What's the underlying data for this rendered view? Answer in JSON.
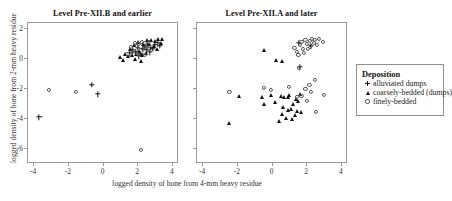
{
  "figure": {
    "xlabel": "logged density of bone from 4-mm heavy residue",
    "ylabel": "logged density of bone from 2-mm heavy residue",
    "xticks": [
      "-4",
      "-2",
      "0",
      "2",
      "4"
    ],
    "yticks": [
      "2",
      "0",
      "-2",
      "-4",
      "-6"
    ]
  },
  "legend": {
    "title": "Deposition",
    "entries": [
      {
        "marker": "plus-marker",
        "label": "alluviated dumps"
      },
      {
        "marker": "triangle-marker",
        "label": "coarsely-bedded (dumps)"
      },
      {
        "marker": "circle-marker",
        "label": "finely-bedded"
      }
    ]
  },
  "chart_data": {
    "type": "scatter",
    "title": "",
    "xlabel": "logged density of bone from 4-mm heavy residue",
    "ylabel": "logged density of bone from 2-mm heavy residue",
    "xlim": [
      -4.35,
      4.35
    ],
    "ylim": [
      -7.0,
      2.4
    ],
    "xticks": [
      -4,
      -2,
      0,
      2,
      4
    ],
    "yticks": [
      2,
      0,
      -2,
      -4,
      -6
    ],
    "grid": false,
    "legend_position": "right-outside",
    "legend_title": "Deposition",
    "series_definitions": [
      {
        "name": "alluviated dumps",
        "marker": "+",
        "color": "#111111"
      },
      {
        "name": "coarsely-bedded (dumps)",
        "marker": "triangle",
        "color": "#111111"
      },
      {
        "name": "finely-bedded",
        "marker": "open-circle",
        "color": "#555555"
      }
    ],
    "panels": [
      {
        "title": "Level Pre-XII.B and earlier",
        "series": [
          {
            "name": "alluviated dumps",
            "marker": "+",
            "points": [
              [
                -3.65,
                -3.95
              ],
              [
                -0.62,
                -1.78
              ],
              [
                -0.28,
                -2.42
              ],
              [
                1.55,
                0.32
              ],
              [
                1.72,
                0.52
              ],
              [
                1.92,
                0.42
              ],
              [
                2.05,
                0.66
              ],
              [
                2.18,
                0.3
              ],
              [
                2.3,
                0.58
              ],
              [
                2.42,
                0.72
              ],
              [
                2.55,
                0.52
              ],
              [
                2.62,
                0.86
              ],
              [
                2.78,
                0.7
              ],
              [
                2.9,
                0.62
              ],
              [
                3.02,
                0.88
              ],
              [
                3.18,
                0.98
              ],
              [
                3.3,
                0.8
              ],
              [
                2.12,
                0.12
              ],
              [
                2.72,
                0.38
              ]
            ]
          },
          {
            "name": "coarsely-bedded (dumps)",
            "marker": "triangle",
            "points": [
              [
                1.02,
                0.05
              ],
              [
                1.18,
                -0.12
              ],
              [
                1.3,
                0.28
              ],
              [
                1.45,
                0.12
              ],
              [
                1.58,
                0.62
              ],
              [
                1.7,
                0.18
              ],
              [
                1.8,
                0.85
              ],
              [
                1.95,
                0.3
              ],
              [
                2.02,
                1.08
              ],
              [
                2.1,
                0.48
              ],
              [
                2.22,
                -0.22
              ],
              [
                2.35,
                0.92
              ],
              [
                2.48,
                0.35
              ],
              [
                2.58,
                1.18
              ],
              [
                2.7,
                0.92
              ],
              [
                2.82,
                1.22
              ],
              [
                2.95,
                0.78
              ],
              [
                3.05,
                1.12
              ],
              [
                3.2,
                1.3
              ],
              [
                3.35,
                0.98
              ],
              [
                3.42,
                1.25
              ],
              [
                2.28,
                0.2
              ],
              [
                1.88,
                -0.05
              ],
              [
                3.12,
                0.62
              ]
            ]
          },
          {
            "name": "finely-bedded",
            "marker": "open-circle",
            "points": [
              [
                -3.1,
                -2.1
              ],
              [
                -1.52,
                -2.26
              ],
              [
                2.2,
                -6.1
              ],
              [
                1.62,
                0.72
              ],
              [
                1.85,
                0.98
              ],
              [
                2.0,
                0.82
              ],
              [
                2.12,
                0.95
              ],
              [
                2.25,
                1.05
              ],
              [
                2.35,
                0.6
              ],
              [
                2.45,
                1.0
              ],
              [
                2.55,
                0.72
              ],
              [
                2.68,
                1.1
              ],
              [
                2.05,
                0.25
              ],
              [
                2.42,
                0.18
              ],
              [
                1.75,
                0.4
              ]
            ]
          }
        ]
      },
      {
        "title": "Level Pre-XII.A and later",
        "series": [
          {
            "name": "alluviated dumps",
            "marker": "+",
            "points": [
              [
                1.58,
                1.02
              ],
              [
                2.28,
                0.78
              ],
              [
                1.62,
                -0.62
              ]
            ]
          },
          {
            "name": "coarsely-bedded (dumps)",
            "marker": "triangle",
            "points": [
              [
                -0.42,
                0.52
              ],
              [
                0.28,
                -0.15
              ],
              [
                0.62,
                -0.18
              ],
              [
                -2.42,
                -4.35
              ],
              [
                -1.88,
                -2.55
              ],
              [
                -0.52,
                -2.58
              ],
              [
                -0.42,
                -3.05
              ],
              [
                -0.05,
                -2.48
              ],
              [
                0.18,
                -2.95
              ],
              [
                0.52,
                -2.52
              ],
              [
                0.72,
                -2.58
              ],
              [
                0.58,
                -3.72
              ],
              [
                0.82,
                -4.02
              ],
              [
                0.95,
                -2.6
              ],
              [
                1.02,
                -2.48
              ],
              [
                1.12,
                -3.38
              ],
              [
                1.25,
                -3.05
              ],
              [
                1.38,
                -3.82
              ],
              [
                1.48,
                -3.52
              ],
              [
                1.52,
                -2.88
              ],
              [
                0.95,
                -3.48
              ],
              [
                1.62,
                -2.42
              ],
              [
                1.72,
                -3.62
              ],
              [
                0.42,
                -4.18
              ],
              [
                1.18,
                -4.08
              ],
              [
                0.65,
                -3.28
              ],
              [
                1.42,
                -2.72
              ]
            ]
          },
          {
            "name": "finely-bedded",
            "marker": "open-circle",
            "points": [
              [
                1.32,
                0.68
              ],
              [
                1.45,
                0.42
              ],
              [
                1.55,
                0.22
              ],
              [
                1.62,
                0.85
              ],
              [
                1.72,
                1.08
              ],
              [
                1.8,
                0.58
              ],
              [
                1.88,
                0.35
              ],
              [
                1.95,
                1.22
              ],
              [
                2.05,
                0.92
              ],
              [
                2.12,
                0.62
              ],
              [
                2.2,
                1.12
              ],
              [
                2.28,
                0.82
              ],
              [
                2.35,
                1.28
              ],
              [
                2.45,
                0.98
              ],
              [
                2.52,
                1.18
              ],
              [
                2.62,
                0.88
              ],
              [
                2.72,
                1.25
              ],
              [
                2.95,
                1.05
              ],
              [
                1.58,
                -0.68
              ],
              [
                -2.42,
                -2.28
              ],
              [
                -0.42,
                -2.02
              ],
              [
                -0.05,
                -2.15
              ],
              [
                1.02,
                -1.95
              ],
              [
                1.45,
                -2.62
              ],
              [
                1.72,
                -2.55
              ],
              [
                2.18,
                -1.78
              ],
              [
                2.28,
                -2.25
              ],
              [
                2.05,
                -2.88
              ],
              [
                3.02,
                -2.45
              ],
              [
                2.55,
                -3.62
              ],
              [
                1.95,
                -2.05
              ],
              [
                2.48,
                -1.48
              ]
            ]
          }
        ]
      }
    ]
  }
}
